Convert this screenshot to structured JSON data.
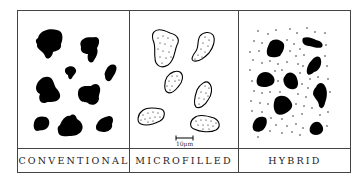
{
  "figure": {
    "panels": [
      {
        "id": "conventional",
        "label": "CONVENTIONAL"
      },
      {
        "id": "microfilled",
        "label": "MICROFILLED"
      },
      {
        "id": "hybrid",
        "label": "HYBRID"
      }
    ],
    "scale_bar": {
      "label": "10μm"
    },
    "colors": {
      "border": "#444444",
      "particle": "#000000",
      "background": "#ffffff"
    }
  }
}
